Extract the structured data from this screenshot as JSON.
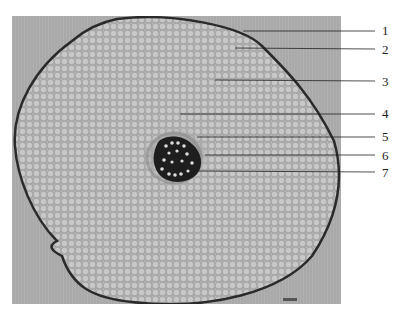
{
  "figure": {
    "type": "micrograph",
    "background_color": "#a9a9a9",
    "tissue_color": "#b5b5b5",
    "stele_color": "#1e1e1e"
  },
  "labels": [
    {
      "number": "1",
      "line_start": [
        243,
        31
      ],
      "line_end": [
        375,
        31
      ]
    },
    {
      "number": "2",
      "line_start": [
        235,
        48
      ],
      "line_end": [
        375,
        49
      ]
    },
    {
      "number": "3",
      "line_start": [
        215,
        80
      ],
      "line_end": [
        375,
        81
      ]
    },
    {
      "number": "4",
      "line_start": [
        180,
        114
      ],
      "line_end": [
        375,
        114
      ]
    },
    {
      "number": "5",
      "line_start": [
        197,
        137
      ],
      "line_end": [
        375,
        137
      ]
    },
    {
      "number": "6",
      "line_start": [
        205,
        155
      ],
      "line_end": [
        375,
        155
      ]
    },
    {
      "number": "7",
      "line_start": [
        197,
        171
      ],
      "line_end": [
        375,
        172
      ]
    }
  ],
  "scale_bar": {
    "present": true
  }
}
